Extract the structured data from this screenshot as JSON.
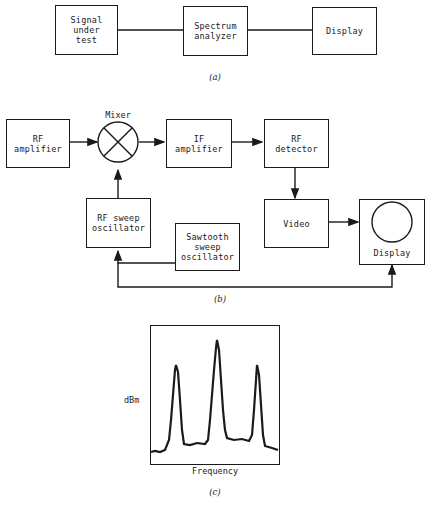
{
  "figure_a": {
    "caption": "(a)",
    "blocks": [
      {
        "id": "signal",
        "label": "Signal\nunder\ntest"
      },
      {
        "id": "analyzer",
        "label": "Spectrum\nanalyzer"
      },
      {
        "id": "display",
        "label": "Display"
      }
    ]
  },
  "figure_b": {
    "caption": "(b)",
    "mixer_label": "Mixer",
    "blocks": [
      {
        "id": "rf_amp",
        "label": "RF\namplifier"
      },
      {
        "id": "if_amp",
        "label": "IF\namplifier"
      },
      {
        "id": "rf_det",
        "label": "RF\ndetector"
      },
      {
        "id": "rf_sweep",
        "label": "RF sweep\noscillator"
      },
      {
        "id": "sawtooth",
        "label": "Sawtooth\nsweep\noscillator"
      },
      {
        "id": "video",
        "label": "Video"
      },
      {
        "id": "display",
        "label": "Display"
      }
    ]
  },
  "figure_c": {
    "caption": "(c)",
    "ylabel": "dBm",
    "xlabel": "Frequency",
    "peaks": [
      {
        "position": "left",
        "relative_height": 0.58
      },
      {
        "position": "center",
        "relative_height": 0.82
      },
      {
        "position": "right",
        "relative_height": 0.58
      }
    ]
  }
}
